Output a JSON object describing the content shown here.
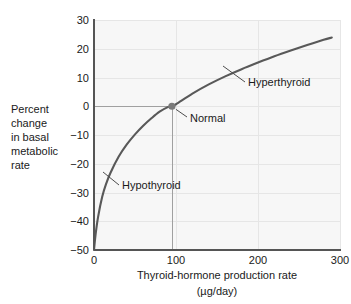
{
  "chart_data": {
    "type": "line",
    "title": "",
    "xlabel": "Thyroid-hormone production rate",
    "xlabel_units": "(µg/day)",
    "ylabel_lines": [
      "Percent",
      "change",
      "in basal",
      "metabolic",
      "rate"
    ],
    "xlim": [
      0,
      300
    ],
    "ylim": [
      -50,
      30
    ],
    "xticks": [
      "0",
      "100",
      "200",
      "300"
    ],
    "xtick_values": [
      0,
      100,
      200,
      300
    ],
    "yticks": [
      "30",
      "20",
      "10",
      "0",
      "−10",
      "−20",
      "−30",
      "−40",
      "−50"
    ],
    "ytick_values": [
      30,
      20,
      10,
      0,
      -10,
      -20,
      -30,
      -40,
      -50
    ],
    "grid": true,
    "legend": "none",
    "series": [
      {
        "name": "basal metabolic rate response",
        "x": [
          0,
          2,
          5,
          10,
          15,
          20,
          30,
          40,
          50,
          60,
          70,
          80,
          90,
          95,
          100,
          120,
          140,
          160,
          180,
          200,
          220,
          240,
          260,
          280,
          290
        ],
        "y": [
          -50,
          -44.5,
          -38.5,
          -31.5,
          -26.8,
          -23.2,
          -17.6,
          -13.3,
          -9.8,
          -6.8,
          -4.2,
          -1.9,
          -0.3,
          0,
          0.7,
          4.4,
          7.6,
          10.4,
          12.9,
          15.2,
          17.4,
          19.4,
          21.3,
          23.1,
          23.9
        ]
      }
    ],
    "markers": [
      {
        "label": "Normal",
        "x": 95,
        "y": 0,
        "color": "#7a7a7a"
      }
    ],
    "reference_lines": [
      {
        "orientation": "horizontal",
        "value": 0,
        "from_x": 0,
        "to_x": 95
      },
      {
        "orientation": "vertical",
        "value": 95,
        "from_y": -50,
        "to_y": 0
      }
    ],
    "annotations": [
      {
        "text": "Hyperthyroid",
        "x": 200,
        "y": 13
      },
      {
        "text": "Normal",
        "x": 112,
        "y": -4
      },
      {
        "text": "Hypothyroid",
        "x": 48,
        "y": -27
      }
    ],
    "colors": {
      "curve": "#595959",
      "plot_background": "#f7f7f7",
      "gridline": "#e3e3e3",
      "axis": "#555555",
      "text": "#1a1a1a",
      "marker": "#7a7a7a",
      "reference_line": "#9a9a9a",
      "leader_line": "#4d4d4d"
    }
  }
}
